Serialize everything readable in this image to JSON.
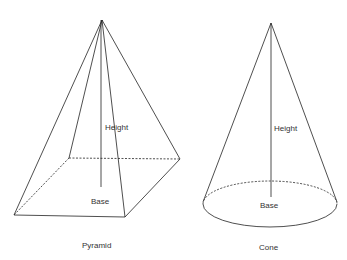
{
  "diagram": {
    "colors": {
      "stroke": "#222222",
      "text": "#333333",
      "background": "#ffffff"
    },
    "pyramid": {
      "title": "Pyramid",
      "height_label": "Height",
      "base_label": "Base",
      "apex": [
        102,
        20
      ],
      "base_corners": {
        "front_left": [
          14,
          215
        ],
        "front_right": [
          125,
          217
        ],
        "back_right": [
          180,
          159
        ],
        "back_left": [
          69,
          158
        ]
      },
      "height_line": {
        "x": 101,
        "y_top": 20,
        "y_bottom": 187
      }
    },
    "cone": {
      "title": "Cone",
      "height_label": "Height",
      "base_label": "Base",
      "apex": [
        271,
        23
      ],
      "base_ellipse": {
        "cx": 270,
        "cy": 204,
        "rx": 67,
        "ry": 23
      },
      "height_line": {
        "x": 271,
        "y_top": 23,
        "y_bottom": 197
      }
    }
  }
}
